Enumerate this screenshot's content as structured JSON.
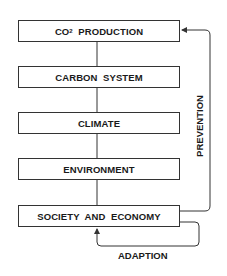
{
  "diagram": {
    "type": "flowchart",
    "boxes": [
      {
        "id": "co2",
        "label_main": "CO",
        "label_sub": "2",
        "label_rest": "  PRODUCTION"
      },
      {
        "id": "carbon",
        "label": "CARBON  SYSTEM"
      },
      {
        "id": "climate",
        "label": "CLIMATE"
      },
      {
        "id": "environment",
        "label": "ENVIRONMENT"
      },
      {
        "id": "society",
        "label": "SOCIETY  AND  ECONOMY"
      }
    ],
    "feedback": {
      "prevention": {
        "label": "PREVENTION",
        "from": "society",
        "to": "co2"
      },
      "adaption": {
        "label": "ADAPTION",
        "from": "society",
        "to": "society"
      }
    },
    "line_color": "#333333"
  }
}
